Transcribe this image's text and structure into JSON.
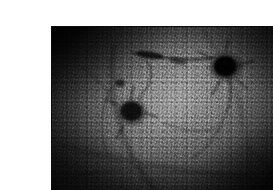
{
  "page": {
    "background_color": "#ffffff",
    "width": 273,
    "height": 190,
    "caption": ""
  },
  "figure": {
    "name": "grayscale-micrograph",
    "modality": "grayscale photomicrograph",
    "frame": {
      "left": 12,
      "top": 11,
      "width": 248,
      "height": 166,
      "border_color": "#0d0d0d",
      "margin_color": "#ffffff"
    },
    "palette": {
      "darkest": "#0c0c0c",
      "shadow": "#242424",
      "midtone": "#5f5f5f",
      "highlight": "#8e8e8e",
      "brightest": "#c9c9c9"
    },
    "tone": {
      "bright_center_x_pct": 52,
      "bright_center_y_pct": 44,
      "vignette_strength": 0.8,
      "illumination_angle_deg": 118
    },
    "features": [
      {
        "id": "lesion-upper-right",
        "label": "dark round lesion",
        "cx_pct": 70,
        "cy_pct": 24,
        "rx_pct": 7.0,
        "ry_pct": 8.0,
        "darkness": 0.93
      },
      {
        "id": "lesion-center-left",
        "label": "dark round lesion",
        "cx_pct": 32,
        "cy_pct": 51,
        "rx_pct": 6.2,
        "ry_pct": 7.4,
        "darkness": 0.9
      },
      {
        "id": "streak-upper-diagonal",
        "label": "dark diagonal streak",
        "x1_pct": 38,
        "y1_pct": 16,
        "x2_pct": 62,
        "y2_pct": 22,
        "darkness": 0.7
      },
      {
        "id": "arc-right-boundary",
        "label": "curved dark boundary",
        "cx_pct": 90,
        "cy_pct": 52,
        "rx_pct": 26,
        "ry_pct": 46,
        "darkness": 0.55
      },
      {
        "id": "arc-lower-left",
        "label": "curved dark boundary",
        "cx_pct": 22,
        "cy_pct": 78,
        "rx_pct": 30,
        "ry_pct": 40,
        "darkness": 0.45
      }
    ],
    "texture": {
      "type": "granular-cobblestone",
      "speckle_scale_px": 4,
      "orientation_deg": 104
    }
  }
}
